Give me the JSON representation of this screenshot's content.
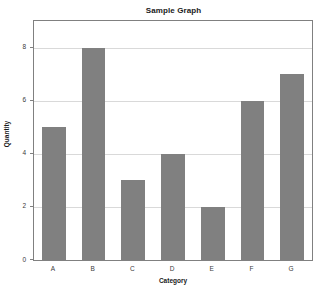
{
  "chart_data": {
    "type": "bar",
    "title": "Sample Graph",
    "xlabel": "Category",
    "ylabel": "Quantity",
    "categories": [
      "A",
      "B",
      "C",
      "D",
      "E",
      "F",
      "G"
    ],
    "values": [
      5,
      8,
      3,
      4,
      2,
      6,
      7
    ],
    "ylim": [
      0,
      9
    ],
    "yticks": [
      0,
      2,
      4,
      6,
      8
    ],
    "ytick_labels": [
      "0",
      "2",
      "4",
      "6",
      "8"
    ],
    "grid": true,
    "legend": null,
    "bar_color": "#808080",
    "gridline_color": "#d9d9d9",
    "axis_color": "#808080",
    "background_color": "#ffffff"
  }
}
